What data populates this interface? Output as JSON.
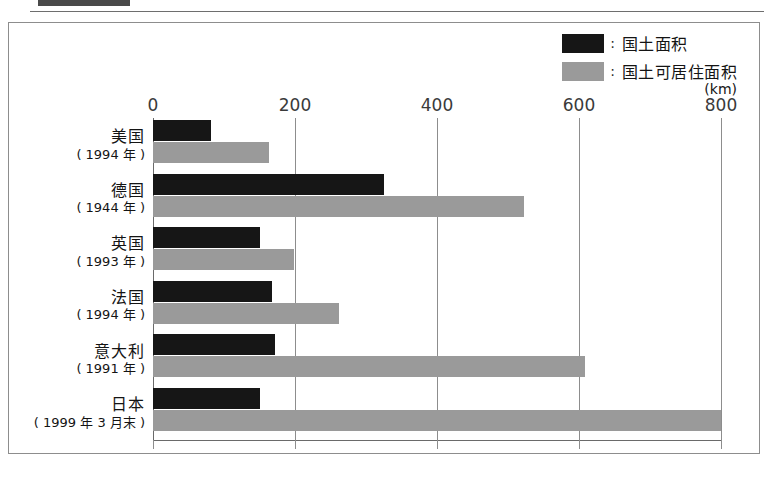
{
  "page": {
    "caption": "",
    "unit_label": "(km)"
  },
  "legend": {
    "items": [
      {
        "label": "国土面积",
        "color": "#161616",
        "separator": ":"
      },
      {
        "label": "国土可居住面积",
        "color": "#9a9a9a",
        "separator": ":"
      }
    ]
  },
  "chart_data": {
    "type": "bar",
    "orientation": "horizontal",
    "title": "",
    "xlabel": "(km)",
    "ylabel": "",
    "xlim": [
      0,
      800
    ],
    "xticks": [
      0,
      200,
      400,
      600,
      800
    ],
    "grid": true,
    "legend_position": "top-right",
    "categories": [
      "美国",
      "德国",
      "英国",
      "法国",
      "意大利",
      "日本"
    ],
    "category_years": [
      "( 1994 年 )",
      "( 1944 年 )",
      "( 1993 年 )",
      "( 1994 年 )",
      "( 1991 年 )",
      "( 1999 年 3 月末 )"
    ],
    "series": [
      {
        "name": "国土面积",
        "color": "#161616",
        "values": [
          82,
          325,
          150,
          168,
          172,
          150
        ]
      },
      {
        "name": "国土可居住面积",
        "color": "#9a9a9a",
        "values": [
          164,
          522,
          199,
          262,
          608,
          800
        ]
      }
    ]
  }
}
